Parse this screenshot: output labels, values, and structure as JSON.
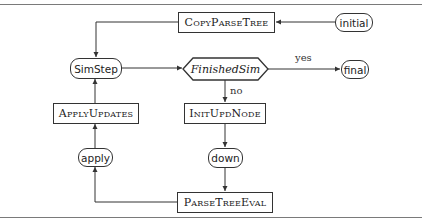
{
  "diagram": {
    "nodes": {
      "copy_parse_tree": {
        "label": "CopyParseTree",
        "shape": "rectangle"
      },
      "initial": {
        "label": "initial",
        "shape": "terminal"
      },
      "sim_step": {
        "label": "SimStep",
        "shape": "terminal"
      },
      "finished_sim": {
        "label": "FinishedSim",
        "shape": "decision"
      },
      "final": {
        "label": "final",
        "shape": "terminal"
      },
      "apply_updates": {
        "label": "ApplyUpdates",
        "shape": "rectangle"
      },
      "init_upd_node": {
        "label": "InitUpdNode",
        "shape": "rectangle"
      },
      "apply": {
        "label": "apply",
        "shape": "terminal"
      },
      "down": {
        "label": "down",
        "shape": "terminal"
      },
      "parse_tree_eval": {
        "label": "ParseTreeEval",
        "shape": "rectangle"
      }
    },
    "edge_labels": {
      "yes": "yes",
      "no": "no"
    },
    "edges": [
      {
        "from": "initial",
        "to": "copy_parse_tree"
      },
      {
        "from": "copy_parse_tree",
        "to": "sim_step"
      },
      {
        "from": "sim_step",
        "to": "finished_sim"
      },
      {
        "from": "finished_sim",
        "to": "final",
        "label": "yes"
      },
      {
        "from": "finished_sim",
        "to": "init_upd_node",
        "label": "no"
      },
      {
        "from": "init_upd_node",
        "to": "down"
      },
      {
        "from": "down",
        "to": "parse_tree_eval"
      },
      {
        "from": "parse_tree_eval",
        "to": "apply"
      },
      {
        "from": "apply",
        "to": "apply_updates"
      },
      {
        "from": "apply_updates",
        "to": "sim_step"
      }
    ],
    "colors": {
      "stroke": "#333333",
      "background": "#ffffff"
    }
  }
}
